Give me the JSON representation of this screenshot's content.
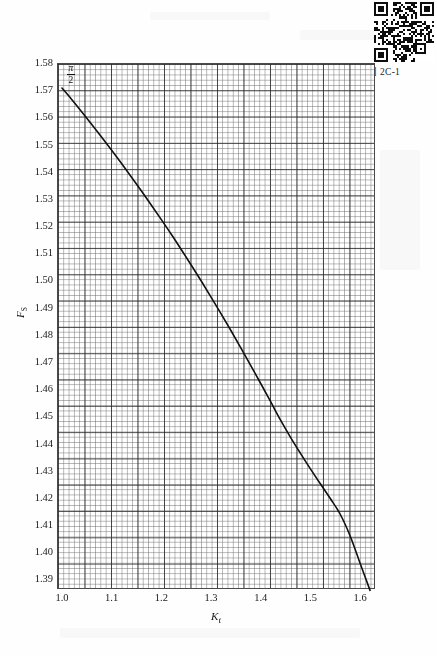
{
  "figure": {
    "caption": "图 2C-1",
    "qr_code_name": "qr-code"
  },
  "chart_data": {
    "type": "line",
    "title": "",
    "xlabel": "K",
    "xlabel_sub": "t",
    "ylabel": "F",
    "ylabel_sub": "S",
    "xlim": [
      0.99,
      1.63
    ],
    "ylim": [
      1.3865,
      1.58
    ],
    "grid": true,
    "grid_minor": true,
    "legend": "none",
    "xticks": [
      "1.0",
      "1.1",
      "1.2",
      "1.3",
      "1.4",
      "1.5",
      "1.6"
    ],
    "xtick_values": [
      1.0,
      1.1,
      1.2,
      1.3,
      1.4,
      1.5,
      1.6
    ],
    "yticks": [
      "1.58",
      "1.57",
      "1.56",
      "1.55",
      "1.54",
      "1.53",
      "1.52",
      "1.51",
      "1.50",
      "1.49",
      "1.48",
      "1.47",
      "1.46",
      "1.45",
      "1.44",
      "1.43",
      "1.42",
      "1.41",
      "1.40",
      "1.39"
    ],
    "ytick_values": [
      1.58,
      1.57,
      1.56,
      1.55,
      1.54,
      1.53,
      1.52,
      1.51,
      1.5,
      1.49,
      1.48,
      1.47,
      1.46,
      1.45,
      1.44,
      1.43,
      1.42,
      1.41,
      1.4,
      1.39
    ],
    "annotations": [
      {
        "name": "pi-over-two",
        "numerator": "π",
        "denominator": "2",
        "x": 1.0,
        "y": 1.5708
      }
    ],
    "series": [
      {
        "name": "F_S vs K_t",
        "color": "#111111",
        "x": [
          1.0,
          1.02,
          1.04,
          1.06,
          1.08,
          1.1,
          1.12,
          1.14,
          1.16,
          1.18,
          1.2,
          1.22,
          1.24,
          1.26,
          1.28,
          1.3,
          1.32,
          1.34,
          1.36,
          1.38,
          1.4,
          1.42,
          1.44,
          1.46,
          1.48,
          1.5,
          1.52,
          1.54,
          1.56,
          1.58,
          1.6,
          1.62
        ],
        "values": [
          1.5708,
          1.5665,
          1.562,
          1.5574,
          1.5527,
          1.5479,
          1.543,
          1.538,
          1.5329,
          1.5277,
          1.5224,
          1.517,
          1.5114,
          1.5057,
          1.4999,
          1.4939,
          1.4878,
          1.4816,
          1.4752,
          1.4687,
          1.4621,
          1.4554,
          1.4486,
          1.4423,
          1.4364,
          1.4307,
          1.4252,
          1.4198,
          1.414,
          1.406,
          1.396,
          1.386
        ]
      }
    ]
  },
  "plot_geometry": {
    "left": 57,
    "top": 63,
    "width": 318,
    "height": 526
  }
}
